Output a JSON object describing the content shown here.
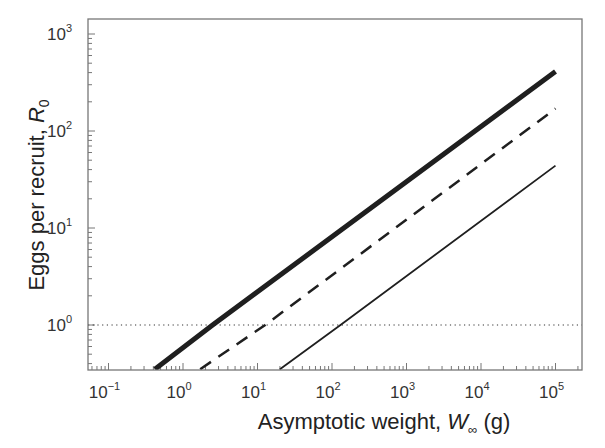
{
  "chart_data": {
    "type": "line",
    "title": "",
    "xlabel": "Asymptotic weight, W∞ (g)",
    "xlabel_parts": {
      "prefix": "Asymptotic weight, ",
      "var": "W",
      "sub": "∞",
      "suffix": " (g)"
    },
    "ylabel": "Eggs per recruit, R0",
    "ylabel_parts": {
      "prefix": "Eggs per recruit, ",
      "var": "R",
      "sub": "0"
    },
    "xscale": "log",
    "yscale": "log",
    "xlim": [
      0.05,
      140000
    ],
    "ylim": [
      0.35,
      1400
    ],
    "x_ticks": [
      {
        "base": "10",
        "exp": "−1",
        "value": 0.1
      },
      {
        "base": "10",
        "exp": "0",
        "value": 1
      },
      {
        "base": "10",
        "exp": "1",
        "value": 10
      },
      {
        "base": "10",
        "exp": "2",
        "value": 100
      },
      {
        "base": "10",
        "exp": "3",
        "value": 1000
      },
      {
        "base": "10",
        "exp": "4",
        "value": 10000
      },
      {
        "base": "10",
        "exp": "5",
        "value": 100000
      }
    ],
    "y_ticks": [
      {
        "base": "10",
        "exp": "0",
        "value": 1
      },
      {
        "base": "10",
        "exp": "1",
        "value": 10
      },
      {
        "base": "10",
        "exp": "2",
        "value": 100
      },
      {
        "base": "10",
        "exp": "3",
        "value": 1000
      }
    ],
    "grid": false,
    "legend": null,
    "series": [
      {
        "name": "thick solid",
        "style": "solid",
        "width": 5,
        "x": [
          0.42,
          2.5,
          100000
        ],
        "y": [
          0.35,
          1.0,
          410
        ]
      },
      {
        "name": "dashed",
        "style": "dashed",
        "width": 2.5,
        "x": [
          1.7,
          12.7,
          100000
        ],
        "y": [
          0.35,
          1.0,
          170
        ]
      },
      {
        "name": "thin solid",
        "style": "solid",
        "width": 1.8,
        "x": [
          20,
          130,
          100000
        ],
        "y": [
          0.35,
          1.0,
          44
        ]
      }
    ],
    "reference_lines": [
      {
        "type": "horizontal",
        "y": 1,
        "style": "dotted",
        "label": "R0 = 1"
      }
    ]
  }
}
